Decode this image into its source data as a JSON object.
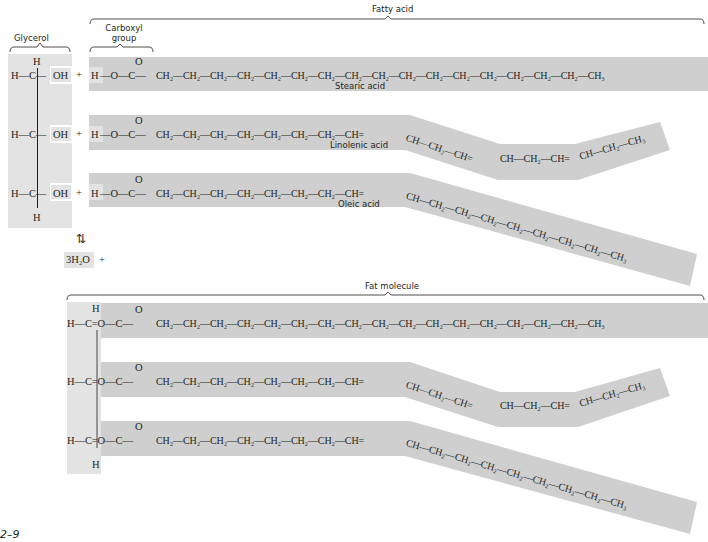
{
  "labels": {
    "glycerol": "Glycerol",
    "carboxyl_group_1": "Carboxyl",
    "carboxyl_group_2": "group",
    "fatty_acid": "Fatty acid",
    "fat_molecule": "Fat molecule",
    "stearic": "Stearic acid",
    "linolenic": "Linolenic acid",
    "oleic": "Oleic acid",
    "figure_number": "2–9",
    "water": "3H₂O",
    "plus": "+",
    "equilibrium": "⇅"
  },
  "glycerol": {
    "top_h": "H",
    "bottom_h": "H",
    "rows": [
      "H—C—",
      "H—C—",
      "H—C—"
    ],
    "oh": "OH",
    "plus": "+"
  },
  "fatty_acids": {
    "head_h": "H",
    "head": "—O—C—",
    "carbonyl_o": "O",
    "stearic_chain": "CH₂—CH₂—CH₂—CH₂—CH₂—CH₂—CH₂—CH₂—CH₂—CH₂—CH₂—CH₂—CH₂—CH₂—CH₂—CH₂—CH₃",
    "unsat_straight": "CH₂—CH₂—CH₂—CH₂—CH₂—CH₂—CH₂—CH=",
    "linolenic_seg1": "CH—CH₂—CH=",
    "linolenic_seg2": "CH—CH₂—CH=",
    "linolenic_seg3": "CH—CH₂—CH₃",
    "oleic_tail": "CH—CH₂—CH₂—CH₂—CH₂—CH₂—CH₂—CH₂—CH₃"
  },
  "fat": {
    "ester_head": "H—C=O—C—",
    "top_h": "H",
    "bottom_h": "H"
  },
  "colors": {
    "glycerol_band": "#e3e3e3",
    "acid_band": "#cfcfcf",
    "text": "#231f20"
  }
}
